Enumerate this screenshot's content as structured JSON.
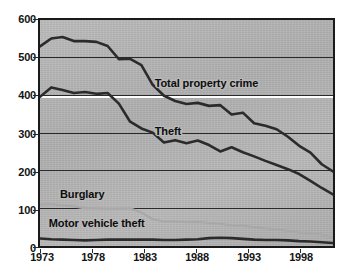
{
  "chart_data": {
    "type": "line",
    "title": "",
    "subtitle": "",
    "xlabel": "",
    "ylabel": "",
    "xlim": [
      1973,
      1999
    ],
    "ylim": [
      0,
      600
    ],
    "grid": true,
    "grid_orientation": "horizontal",
    "legend_position": "inline-annotations",
    "y_ticks": [
      600,
      500,
      400,
      300,
      200,
      100,
      0
    ],
    "x_ticks": [
      1973,
      1978,
      1983,
      1988,
      1993,
      1998
    ],
    "x": [
      1973,
      1974,
      1975,
      1976,
      1977,
      1978,
      1979,
      1980,
      1981,
      1982,
      1983,
      1984,
      1985,
      1986,
      1987,
      1988,
      1989,
      1990,
      1991,
      1992,
      1993,
      1994,
      1995,
      1996,
      1997,
      1998,
      1999
    ],
    "series": [
      {
        "name": "Total property crime",
        "color": "#2b2b2b",
        "values": [
          530,
          551,
          555,
          544,
          544,
          542,
          531,
          496,
          497,
          480,
          428,
          399,
          385,
          377,
          380,
          372,
          374,
          349,
          354,
          326,
          319,
          310,
          290,
          266,
          248,
          217,
          198
        ]
      },
      {
        "name": "Theft",
        "color": "#2b2b2b",
        "values": [
          396,
          421,
          414,
          406,
          409,
          404,
          406,
          378,
          330,
          312,
          301,
          275,
          281,
          273,
          280,
          268,
          251,
          262,
          249,
          238,
          226,
          215,
          204,
          191,
          173,
          154,
          137
        ]
      },
      {
        "name": "Burglary",
        "color": "#a8a8a8",
        "values": [
          110,
          111,
          108,
          105,
          100,
          100,
          99,
          99,
          100,
          89,
          71,
          65,
          65,
          63,
          64,
          61,
          59,
          55,
          54,
          50,
          47,
          44,
          40,
          36,
          34,
          31,
          21
        ]
      },
      {
        "name": "Motor vehicle theft",
        "color": "#2b2b2b",
        "values": [
          20,
          18,
          17,
          16,
          15,
          16,
          17,
          17,
          17,
          17,
          17,
          16,
          16,
          17,
          18,
          21,
          22,
          21,
          19,
          17,
          16,
          16,
          15,
          13,
          12,
          10,
          8
        ]
      }
    ],
    "annotations": [
      {
        "text": "Total property crime",
        "x": 1983.0,
        "y": 432
      },
      {
        "text": "Theft",
        "x": 1983.0,
        "y": 306
      },
      {
        "text": "Burglary",
        "x": 1974.6,
        "y": 139
      },
      {
        "text": "Motor vehicle theft",
        "x": 1973.6,
        "y": 60
      }
    ],
    "colors": {
      "plot_background": "#b4b4b4",
      "frame": "#1a1a1a",
      "gridline": "#2a2a2a",
      "highlight_gridline": "#ffffff",
      "dark_series": "#2b2b2b",
      "light_series": "#a8a8a8",
      "text": "#141414"
    }
  },
  "axis": {
    "y_labels": [
      "600",
      "500",
      "400",
      "300",
      "200",
      "100",
      "0"
    ],
    "x_labels": [
      "1973",
      "1978",
      "1983",
      "1988",
      "1993",
      "1998"
    ]
  },
  "labels": {
    "total_property_crime": "Total property crime",
    "theft": "Theft",
    "burglary": "Burglary",
    "motor_vehicle_theft": "Motor vehicle theft"
  }
}
